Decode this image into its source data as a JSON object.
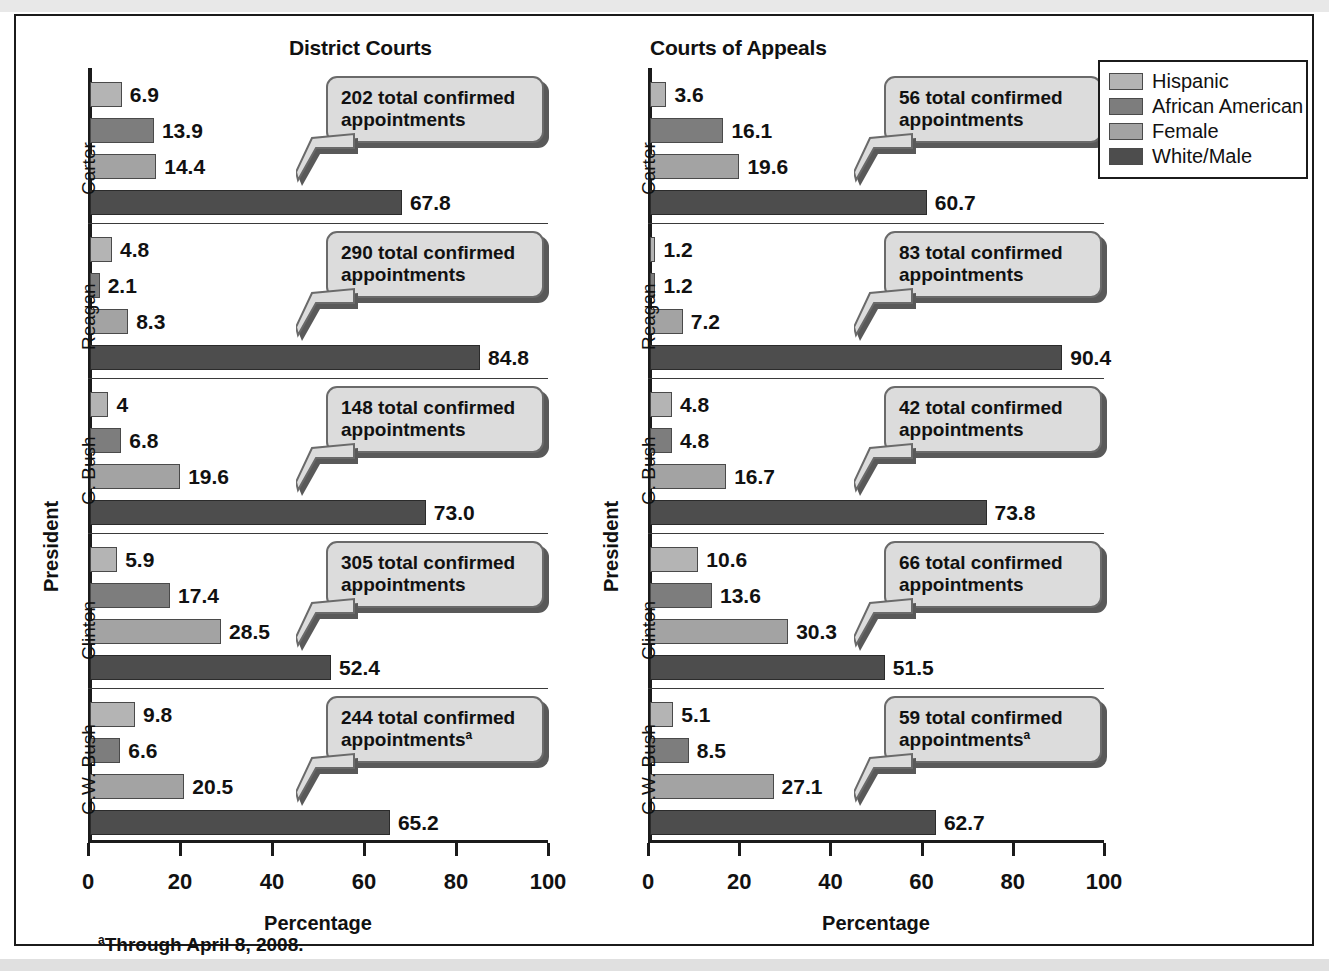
{
  "legend": {
    "items": [
      {
        "label": "Hispanic",
        "color": "#b4b4b4"
      },
      {
        "label": "African American",
        "color": "#7d7d7d"
      },
      {
        "label": "Female",
        "color": "#a3a3a3"
      },
      {
        "label": "White/Male",
        "color": "#4d4d4d"
      }
    ]
  },
  "footnote": {
    "marker": "a",
    "text": "Through April 8, 2008."
  },
  "axis": {
    "ylabel": "President",
    "xlabel": "Percentage",
    "ticks": [
      "0",
      "20",
      "40",
      "60",
      "80",
      "100"
    ]
  },
  "chart_data": {
    "type": "bar",
    "title": "",
    "orientation": "horizontal",
    "xlabel": "Percentage",
    "ylabel": "President",
    "xlim": [
      0,
      100
    ],
    "xticks": [
      0,
      20,
      40,
      60,
      80,
      100
    ],
    "grid": false,
    "legend_position": "top-right",
    "series_names": [
      "Hispanic",
      "African American",
      "Female",
      "White/Male"
    ],
    "series_colors": [
      "#b4b4b4",
      "#7d7d7d",
      "#a3a3a3",
      "#4d4d4d"
    ],
    "categories": [
      "Carter",
      "Reagan",
      "G. Bush",
      "Clinton",
      "G.W. Bush"
    ],
    "panels": [
      {
        "name": "District Courts",
        "title": "District Courts",
        "groups": [
          {
            "category": "Carter",
            "total_label": "202 total confirmed appointments",
            "total": 202,
            "footnote_marker": "",
            "bars": [
              {
                "series": "Hispanic",
                "value": 6.9,
                "label": "6.9"
              },
              {
                "series": "African American",
                "value": 13.9,
                "label": "13.9"
              },
              {
                "series": "Female",
                "value": 14.4,
                "label": "14.4"
              },
              {
                "series": "White/Male",
                "value": 67.8,
                "label": "67.8"
              }
            ]
          },
          {
            "category": "Reagan",
            "total_label": "290 total confirmed appointments",
            "total": 290,
            "footnote_marker": "",
            "bars": [
              {
                "series": "Hispanic",
                "value": 4.8,
                "label": "4.8"
              },
              {
                "series": "African American",
                "value": 2.1,
                "label": "2.1"
              },
              {
                "series": "Female",
                "value": 8.3,
                "label": "8.3"
              },
              {
                "series": "White/Male",
                "value": 84.8,
                "label": "84.8"
              }
            ]
          },
          {
            "category": "G. Bush",
            "total_label": "148 total confirmed appointments",
            "total": 148,
            "footnote_marker": "",
            "bars": [
              {
                "series": "Hispanic",
                "value": 4,
                "label": "4"
              },
              {
                "series": "African American",
                "value": 6.8,
                "label": "6.8"
              },
              {
                "series": "Female",
                "value": 19.6,
                "label": "19.6"
              },
              {
                "series": "White/Male",
                "value": 73.0,
                "label": "73.0"
              }
            ]
          },
          {
            "category": "Clinton",
            "total_label": "305 total confirmed appointments",
            "total": 305,
            "footnote_marker": "",
            "bars": [
              {
                "series": "Hispanic",
                "value": 5.9,
                "label": "5.9"
              },
              {
                "series": "African American",
                "value": 17.4,
                "label": "17.4"
              },
              {
                "series": "Female",
                "value": 28.5,
                "label": "28.5"
              },
              {
                "series": "White/Male",
                "value": 52.4,
                "label": "52.4"
              }
            ]
          },
          {
            "category": "G.W. Bush",
            "total_label": "244 total confirmed appointments",
            "total": 244,
            "footnote_marker": "a",
            "bars": [
              {
                "series": "Hispanic",
                "value": 9.8,
                "label": "9.8"
              },
              {
                "series": "African American",
                "value": 6.6,
                "label": "6.6"
              },
              {
                "series": "Female",
                "value": 20.5,
                "label": "20.5"
              },
              {
                "series": "White/Male",
                "value": 65.2,
                "label": "65.2"
              }
            ]
          }
        ]
      },
      {
        "name": "Courts of Appeals",
        "title": "Courts of Appeals",
        "groups": [
          {
            "category": "Carter",
            "total_label": "56 total confirmed appointments",
            "total": 56,
            "footnote_marker": "",
            "bars": [
              {
                "series": "Hispanic",
                "value": 3.6,
                "label": "3.6"
              },
              {
                "series": "African American",
                "value": 16.1,
                "label": "16.1"
              },
              {
                "series": "Female",
                "value": 19.6,
                "label": "19.6"
              },
              {
                "series": "White/Male",
                "value": 60.7,
                "label": "60.7"
              }
            ]
          },
          {
            "category": "Reagan",
            "total_label": "83 total confirmed appointments",
            "total": 83,
            "footnote_marker": "",
            "bars": [
              {
                "series": "Hispanic",
                "value": 1.2,
                "label": "1.2"
              },
              {
                "series": "African American",
                "value": 1.2,
                "label": "1.2"
              },
              {
                "series": "Female",
                "value": 7.2,
                "label": "7.2"
              },
              {
                "series": "White/Male",
                "value": 90.4,
                "label": "90.4"
              }
            ]
          },
          {
            "category": "G. Bush",
            "total_label": "42 total confirmed appointments",
            "total": 42,
            "footnote_marker": "",
            "bars": [
              {
                "series": "Hispanic",
                "value": 4.8,
                "label": "4.8"
              },
              {
                "series": "African American",
                "value": 4.8,
                "label": "4.8"
              },
              {
                "series": "Female",
                "value": 16.7,
                "label": "16.7"
              },
              {
                "series": "White/Male",
                "value": 73.8,
                "label": "73.8"
              }
            ]
          },
          {
            "category": "Clinton",
            "total_label": "66 total confirmed appointments",
            "total": 66,
            "footnote_marker": "",
            "bars": [
              {
                "series": "Hispanic",
                "value": 10.6,
                "label": "10.6"
              },
              {
                "series": "African American",
                "value": 13.6,
                "label": "13.6"
              },
              {
                "series": "Female",
                "value": 30.3,
                "label": "30.3"
              },
              {
                "series": "White/Male",
                "value": 51.5,
                "label": "51.5"
              }
            ]
          },
          {
            "category": "G.W. Bush",
            "total_label": "59 total confirmed appointments",
            "total": 59,
            "footnote_marker": "a",
            "bars": [
              {
                "series": "Hispanic",
                "value": 5.1,
                "label": "5.1"
              },
              {
                "series": "African American",
                "value": 8.5,
                "label": "8.5"
              },
              {
                "series": "Female",
                "value": 27.1,
                "label": "27.1"
              },
              {
                "series": "White/Male",
                "value": 62.7,
                "label": "62.7"
              }
            ]
          }
        ]
      }
    ]
  }
}
